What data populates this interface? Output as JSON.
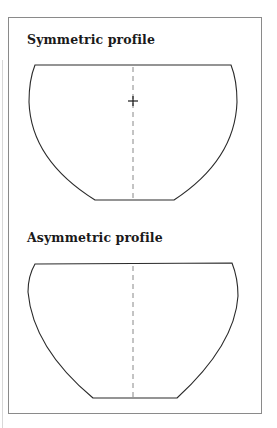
{
  "figure": {
    "panels": [
      {
        "title": "Symmetric profile",
        "has_center_line": true,
        "has_crosshair": true
      },
      {
        "title": "Asymmetric profile",
        "has_center_line": true,
        "has_crosshair": false
      }
    ],
    "colors": {
      "outline": "#2a2a2a",
      "center_line": "#7a7a7a",
      "frame": "#8a8a8a"
    }
  }
}
